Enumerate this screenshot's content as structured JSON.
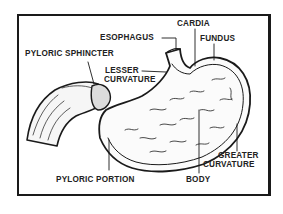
{
  "diagram": {
    "labels": {
      "cardia": "CARDIA",
      "esophagus": "ESOPHAGUS",
      "fundus": "FUNDUS",
      "pyloric_sphincter": "PYLORIC SPHINCTER",
      "lesser_curvature_1": "LESSER",
      "lesser_curvature_2": "CURVATURE",
      "greater_curvature_1": "GREATER",
      "greater_curvature_2": "CURVATURE",
      "pyloric_portion": "PYLORIC PORTION",
      "body": "BODY"
    },
    "colors": {
      "ink": "#1a1a1a",
      "background": "#ffffff"
    }
  }
}
